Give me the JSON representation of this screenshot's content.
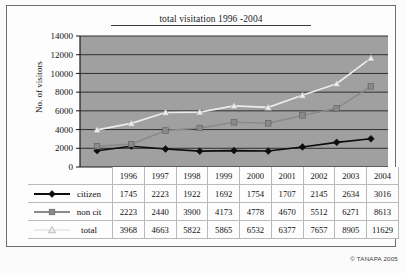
{
  "figure": {
    "copyright": "© TANAPA 2005"
  },
  "chart_data": {
    "type": "line",
    "title": "total visitation 1996 -2004",
    "xlabel": "",
    "ylabel": "No. of visitors",
    "categories": [
      "1996",
      "1997",
      "1998",
      "1999",
      "2000",
      "2001",
      "2002",
      "2003",
      "2004"
    ],
    "ylim": [
      0,
      14000
    ],
    "yticks": [
      0,
      2000,
      4000,
      6000,
      8000,
      10000,
      12000,
      14000
    ],
    "ytick_labels": [
      "0",
      "2000",
      "4000",
      "6000",
      "8000",
      "10000",
      "12000",
      "14000"
    ],
    "grid": true,
    "legend_position": "table-left",
    "plot_background": "#a0a0a0",
    "series": [
      {
        "name": "citizen",
        "marker": "diamond",
        "color": "#0d0d0d",
        "values": [
          1745,
          2223,
          1922,
          1692,
          1754,
          1707,
          2145,
          2634,
          3016
        ]
      },
      {
        "name": "non cit",
        "marker": "square",
        "color": "#8a8a8a",
        "values": [
          2223,
          2440,
          3900,
          4173,
          4778,
          4670,
          5512,
          6271,
          8613
        ]
      },
      {
        "name": "total",
        "marker": "triangle",
        "color": "#ececec",
        "values": [
          3968,
          4663,
          5822,
          5865,
          6532,
          6377,
          7657,
          8905,
          11629
        ]
      }
    ]
  }
}
